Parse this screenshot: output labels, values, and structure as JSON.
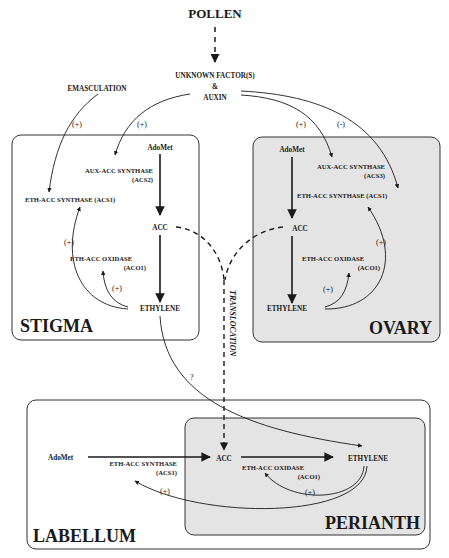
{
  "top": {
    "pollen": "POLLEN",
    "unknown_factor": "UNKNOWN FACTOR(S)",
    "ampersand": "&",
    "auxin": "AUXIN",
    "emasculation": "EMASCULATION",
    "signs": {
      "emasculation_to_acs1": "(+)",
      "auxin_to_acs2": "(+)",
      "auxin_to_acs3": "(+)",
      "auxin_to_ovary_acs1": "(-)"
    }
  },
  "stigma": {
    "region_label": "STIGMA",
    "adomet": "AdoMet",
    "aux_acc_synthase": "AUX-ACC SYNTHASE",
    "aux_acc_synthase_code": "(ACS2)",
    "eth_acc_synthase": "ETH-ACC SYNTHASE (ACS1)",
    "acc": "ACC",
    "eth_acc_oxidase": "ETH-ACC OXIDASE",
    "eth_acc_oxidase_code": "(ACO1)",
    "ethylene": "ETHYLENE",
    "sign_feedback_synthase": "(+)",
    "sign_feedback_oxidase": "(+)"
  },
  "ovary": {
    "region_label": "OVARY",
    "adomet": "AdoMet",
    "aux_acc_synthase": "AUX-ACC SYNTHASE",
    "aux_acc_synthase_code": "(ACS3)",
    "eth_acc_synthase": "ETH-ACC SYNTHASE (ACS1)",
    "acc": "ACC",
    "eth_acc_oxidase": "ETH-ACC OXIDASE",
    "eth_acc_oxidase_code": "(ACO1)",
    "ethylene": "ETHYLENE",
    "sign_feedback_synthase": "(+)",
    "sign_feedback_oxidase": "(+)"
  },
  "middle": {
    "translocation": "TRANSLOCATION",
    "question": "?"
  },
  "labellum": {
    "region_label": "LABELLUM",
    "adomet": "AdoMet",
    "eth_acc_synthase": "ETH-ACC SYNTHASE",
    "eth_acc_synthase_code": "(ACS1)",
    "sign_feedback_synthase": "(+)"
  },
  "perianth": {
    "region_label": "PERIANTH",
    "acc": "ACC",
    "eth_acc_oxidase": "ETH-ACC OXIDASE",
    "eth_acc_oxidase_code": "(ACO1)",
    "ethylene": "ETHYLENE",
    "sign_feedback_oxidase": "(+)"
  },
  "colors": {
    "line": "#1a1a1a",
    "shaded_box": "#e4e4e4",
    "plain_box": "#ffffff"
  }
}
